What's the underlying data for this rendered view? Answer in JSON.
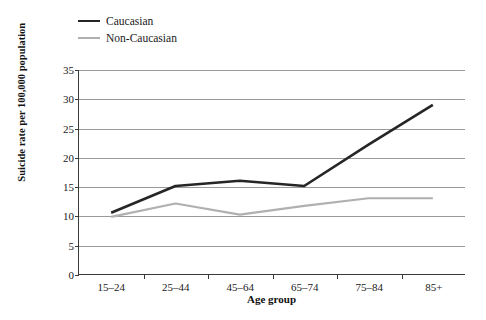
{
  "chart_data": {
    "type": "line",
    "title": "",
    "xlabel": "Age group",
    "ylabel": "Suicide rate per 100,000 population",
    "categories": [
      "15–24",
      "25–44",
      "45–64",
      "65–74",
      "75–84",
      "85+"
    ],
    "ylim": [
      0,
      35
    ],
    "yticks": [
      0,
      5,
      10,
      15,
      20,
      25,
      30,
      35
    ],
    "ytick_labels": [
      "0",
      "5",
      "10",
      "15",
      "20",
      "25",
      "30",
      "35"
    ],
    "grid": "horizontal",
    "legend_position": "top-left",
    "series": [
      {
        "name": "Caucasian",
        "color": "#262626",
        "values": [
          10.5,
          15.1,
          16.0,
          15.1,
          22.2,
          29.0
        ]
      },
      {
        "name": "Non-Caucasian",
        "color": "#b0b0b0",
        "values": [
          9.8,
          12.1,
          10.2,
          11.7,
          13.0,
          13.0
        ]
      }
    ]
  },
  "legend": {
    "items": [
      {
        "label": "Caucasian",
        "swatch": "dark"
      },
      {
        "label": "Non-Caucasian",
        "swatch": "light"
      }
    ]
  }
}
